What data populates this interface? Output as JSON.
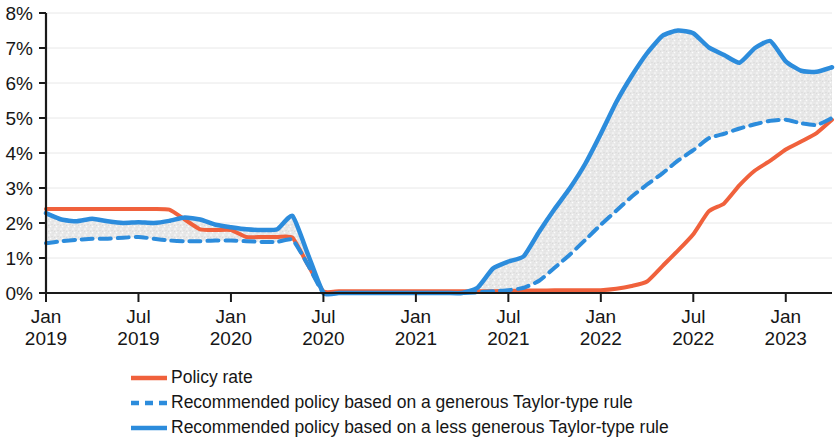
{
  "chart_data": {
    "type": "line",
    "title": "",
    "subtitle": "",
    "xlabel": "",
    "ylabel": "",
    "ylim": [
      0,
      8
    ],
    "ytick_labels": [
      "0%",
      "1%",
      "2%",
      "3%",
      "4%",
      "5%",
      "6%",
      "7%",
      "8%"
    ],
    "ytick_values": [
      0,
      1,
      2,
      3,
      4,
      5,
      6,
      7,
      8
    ],
    "xtick_labels": [
      {
        "month": "Jan",
        "year": "2019"
      },
      {
        "month": "Jul",
        "year": "2019"
      },
      {
        "month": "Jan",
        "year": "2020"
      },
      {
        "month": "Jul",
        "year": "2020"
      },
      {
        "month": "Jan",
        "year": "2021"
      },
      {
        "month": "Jul",
        "year": "2021"
      },
      {
        "month": "Jan",
        "year": "2022"
      },
      {
        "month": "Jul",
        "year": "2022"
      },
      {
        "month": "Jan",
        "year": "2023"
      }
    ],
    "xtick_positions": [
      0,
      6,
      12,
      18,
      24,
      30,
      36,
      42,
      48
    ],
    "xlim": [
      0,
      51
    ],
    "grid": true,
    "grid_axis": "y",
    "legend_position": "below",
    "fill_between": {
      "label": "range between Taylor-type rules",
      "series_a": "recommended_generous",
      "series_b": "recommended_less_generous",
      "color": "#e4e4e4"
    },
    "x_months": [
      0,
      1,
      2,
      3,
      4,
      5,
      6,
      7,
      8,
      9,
      10,
      11,
      12,
      13,
      14,
      15,
      16,
      17,
      18,
      19,
      20,
      21,
      22,
      23,
      24,
      25,
      26,
      27,
      28,
      29,
      30,
      31,
      32,
      33,
      34,
      35,
      36,
      37,
      38,
      39,
      40,
      41,
      42,
      43,
      44,
      45,
      46,
      47,
      48,
      49,
      50,
      51
    ],
    "series": [
      {
        "name": "Policy rate",
        "key": "policy_rate",
        "color": "#f0613c",
        "style": "solid",
        "width": 4,
        "values": [
          2.4,
          2.4,
          2.4,
          2.4,
          2.4,
          2.4,
          2.4,
          2.4,
          2.38,
          2.1,
          1.82,
          1.8,
          1.8,
          1.6,
          1.6,
          1.6,
          1.58,
          0.8,
          0.05,
          0.05,
          0.05,
          0.05,
          0.05,
          0.05,
          0.05,
          0.05,
          0.05,
          0.05,
          0.05,
          0.05,
          0.06,
          0.07,
          0.07,
          0.08,
          0.08,
          0.08,
          0.08,
          0.12,
          0.2,
          0.33,
          0.77,
          1.21,
          1.68,
          2.33,
          2.56,
          3.08,
          3.5,
          3.78,
          4.1,
          4.33,
          4.57,
          4.95
        ]
      },
      {
        "name": "Recommended policy based on a generous Taylor-type rule",
        "key": "recommended_generous",
        "color": "#2c8cdc",
        "style": "dashed",
        "width": 4,
        "values": [
          1.42,
          1.48,
          1.52,
          1.55,
          1.55,
          1.58,
          1.6,
          1.55,
          1.5,
          1.48,
          1.48,
          1.5,
          1.5,
          1.48,
          1.46,
          1.46,
          1.52,
          0.8,
          0.0,
          0.0,
          0.0,
          0.0,
          0.0,
          0.0,
          0.0,
          0.0,
          0.0,
          0.0,
          0.02,
          0.05,
          0.08,
          0.15,
          0.35,
          0.72,
          1.1,
          1.52,
          1.95,
          2.35,
          2.75,
          3.1,
          3.42,
          3.78,
          4.08,
          4.42,
          4.55,
          4.7,
          4.82,
          4.92,
          4.95,
          4.85,
          4.8,
          5.0
        ]
      },
      {
        "name": "Recommended policy based on a less generous Taylor-type rule",
        "key": "recommended_less_generous",
        "color": "#2c8cdc",
        "style": "solid",
        "width": 4.5,
        "values": [
          2.28,
          2.1,
          2.05,
          2.12,
          2.05,
          2.0,
          2.02,
          2.0,
          2.06,
          2.16,
          2.1,
          1.95,
          1.88,
          1.82,
          1.8,
          1.82,
          2.2,
          1.1,
          0.0,
          0.0,
          0.0,
          0.0,
          0.0,
          0.0,
          0.0,
          0.0,
          0.0,
          0.0,
          0.15,
          0.7,
          0.9,
          1.05,
          1.75,
          2.4,
          3.0,
          3.7,
          4.55,
          5.45,
          6.2,
          6.85,
          7.35,
          7.5,
          7.42,
          7.02,
          6.8,
          6.58,
          7.0,
          7.2,
          6.62,
          6.35,
          6.32,
          6.45
        ]
      }
    ]
  },
  "legend": {
    "items": [
      {
        "label": "Policy rate",
        "color": "#f0613c",
        "style": "solid"
      },
      {
        "label": "Recommended policy based on a generous Taylor-type rule",
        "color": "#2c8cdc",
        "style": "dashed"
      },
      {
        "label": "Recommended policy based on a less generous Taylor-type rule",
        "color": "#2c8cdc",
        "style": "solid"
      }
    ]
  },
  "axis": {
    "axis_color": "#1a1a1a",
    "grid_color": "#e8e8e8"
  }
}
